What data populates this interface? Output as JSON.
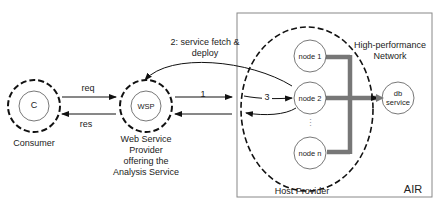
{
  "diagram": {
    "consumer": {
      "symbol": "C",
      "caption": "Consumer"
    },
    "wsp": {
      "symbol": "WSP",
      "caption_lines": [
        "Web Service",
        "Provider",
        "offering the",
        "Analysis Service"
      ]
    },
    "arrows": {
      "req": "req",
      "res": "res",
      "step1": "1",
      "step2_line1": "2: service fetch &",
      "step2_line2": "deploy",
      "step3": "3"
    },
    "air": {
      "label": "AIR",
      "host_provider": "Host Provider",
      "network_line1": "High-performance",
      "network_line2": "Network",
      "nodes": [
        "node 1",
        "node 2",
        "node n"
      ],
      "ellipsis": "⋮",
      "db_line1": "db",
      "db_line2": "service"
    }
  }
}
